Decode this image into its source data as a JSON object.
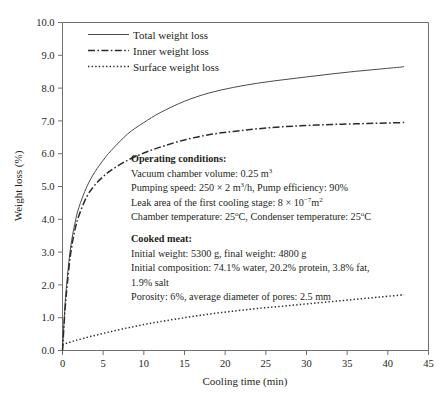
{
  "chart_data": {
    "type": "line",
    "title": "",
    "xlabel": "Cooling time (min)",
    "ylabel": "Weight loss (%)",
    "xlim": [
      0,
      45
    ],
    "ylim": [
      0,
      10
    ],
    "xticks": [
      "0",
      "5",
      "10",
      "15",
      "20",
      "25",
      "30",
      "35",
      "40",
      "45"
    ],
    "yticks": [
      "0.0",
      "1.0",
      "2.0",
      "3.0",
      "4.0",
      "5.0",
      "6.0",
      "7.0",
      "8.0",
      "9.0",
      "10.0"
    ],
    "grid": false,
    "legend_position": "top-center",
    "x": [
      0,
      0.3,
      0.6,
      1,
      1.5,
      2,
      3,
      4,
      5,
      6,
      8,
      10,
      12,
      15,
      18,
      21,
      24,
      27,
      30,
      33,
      36,
      39,
      42
    ],
    "series": [
      {
        "name": "Total weight loss",
        "style": "solid",
        "values": [
          0.0,
          1.35,
          2.25,
          3.15,
          3.85,
          4.35,
          5.0,
          5.45,
          5.8,
          6.1,
          6.6,
          6.95,
          7.25,
          7.6,
          7.85,
          8.02,
          8.15,
          8.25,
          8.34,
          8.43,
          8.51,
          8.58,
          8.65
        ]
      },
      {
        "name": "Inner weight loss",
        "style": "dash-dot",
        "values": [
          0.0,
          1.2,
          2.05,
          2.95,
          3.65,
          4.1,
          4.7,
          5.05,
          5.3,
          5.5,
          5.8,
          6.02,
          6.2,
          6.42,
          6.58,
          6.68,
          6.76,
          6.82,
          6.86,
          6.89,
          6.91,
          6.93,
          6.95
        ]
      },
      {
        "name": "Surface weight loss",
        "style": "dotted",
        "values": [
          0.17,
          0.2,
          0.23,
          0.26,
          0.3,
          0.33,
          0.4,
          0.46,
          0.52,
          0.58,
          0.69,
          0.79,
          0.88,
          1.0,
          1.11,
          1.2,
          1.28,
          1.35,
          1.42,
          1.49,
          1.56,
          1.63,
          1.7
        ]
      }
    ],
    "annotations": [
      {
        "heading": "Operating conditions:",
        "lines": [
          "Vacuum chamber volume: 0.25 m³",
          "Pumping speed: 250 × 2 m³/h, Pump efficiency: 90%",
          "Leak area of the first cooling stage: 8 × 10⁻⁷m²",
          "Chamber temperature: 25°C, Condenser temperature: 25°C"
        ]
      },
      {
        "heading": "Cooked meat:",
        "lines": [
          "Initial weight: 5300 g, final weight: 4800 g",
          "Initial composition: 74.1% water, 20.2% protein, 3.8% fat, 1.9% salt",
          "Porosity: 6%, average diameter of pores: 2.5 mm"
        ]
      }
    ]
  },
  "legend": {
    "items": [
      {
        "label": "Total weight loss"
      },
      {
        "label": "Inner weight loss"
      },
      {
        "label": "Surface weight loss"
      }
    ]
  },
  "annotation_text": {
    "operating_heading": "Operating conditions:",
    "op_line1_a": "Vacuum chamber volume: 0.25 m",
    "op_line1_sup": "3",
    "op_line2_a": "Pumping speed: 250 × 2 m",
    "op_line2_sup": "3",
    "op_line2_b": "/h, Pump efficiency: 90%",
    "op_line3_a": "Leak area of the first cooling stage: 8 × 10",
    "op_line3_sup": "−7",
    "op_line3_b": "m",
    "op_line3_sup2": "2",
    "op_line4_a": "Chamber temperature: 25",
    "op_line4_sup": "o",
    "op_line4_b": "C, Condenser temperature: 25",
    "op_line4_sup2": "o",
    "op_line4_c": "C",
    "meat_heading": "Cooked meat:",
    "meat_line1": "Initial weight: 5300 g, final weight: 4800 g",
    "meat_line2": "Initial composition: 74.1% water, 20.2% protein, 3.8% fat, 1.9% salt",
    "meat_line3": "Porosity: 6%, average diameter of pores: 2.5 mm"
  },
  "colors": {
    "total": "#4a4a4a",
    "inner": "#2b2b2b",
    "surface": "#2b2b2b",
    "axis": "#6f6f6f",
    "text": "#231f20",
    "background": "#ffffff"
  }
}
